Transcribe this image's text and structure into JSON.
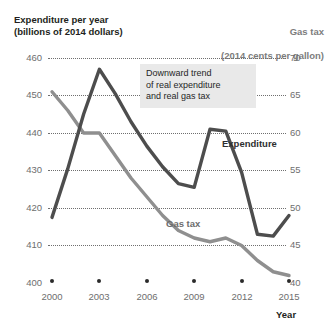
{
  "left_axis": {
    "title": "Expenditure per year\n(billions of 2014 dollars)",
    "ticks": [
      "460",
      "450",
      "440",
      "430",
      "420",
      "410",
      "400"
    ]
  },
  "right_axis": {
    "title_line1": "Gas tax",
    "title_line2": "(2014 cents per gallon)",
    "ticks": [
      "70",
      "65",
      "60",
      "55",
      "50",
      "45",
      "40"
    ]
  },
  "x_axis": {
    "title": "Year",
    "ticks": [
      "2000",
      "2003",
      "2006",
      "2009",
      "2012",
      "2015"
    ]
  },
  "callout": {
    "text": "Downward trend\nof real expenditure\nand real gas tax"
  },
  "series_labels": {
    "expenditure": "Expenditure",
    "gas_tax": "Gas tax"
  },
  "colors": {
    "expenditure_line": "#4d4d4d",
    "gas_tax_line": "#8f8f8f",
    "gridline": "#6f6f6f",
    "callout_bg": "#e9e9e9",
    "axis_text": "#6e6e6e",
    "title_text": "#231f20"
  },
  "chart_data": {
    "type": "line",
    "xlabel": "Year",
    "ylabel": "Expenditure per year (billions of 2014 dollars)",
    "y2label": "Gas tax (2014 cents per gallon)",
    "ylim": [
      400,
      460
    ],
    "y2lim": [
      40,
      70
    ],
    "xlim": [
      2000,
      2015
    ],
    "yticks": [
      400,
      410,
      420,
      430,
      440,
      450,
      460
    ],
    "y2ticks": [
      40,
      45,
      50,
      55,
      60,
      65,
      70
    ],
    "xticks": [
      2000,
      2003,
      2006,
      2009,
      2012,
      2015
    ],
    "grid": "horizontal-dotted",
    "legend": "inline-labels",
    "annotations": [
      {
        "text": "Downward trend of real expenditure and real gas tax",
        "x": 2006,
        "y": 447
      }
    ],
    "series": [
      {
        "name": "Expenditure",
        "axis": "left",
        "units": "billions of 2014 dollars",
        "color": "#4d4d4d",
        "x": [
          2000,
          2001,
          2002,
          2003,
          2004,
          2005,
          2006,
          2007,
          2008,
          2009,
          2010,
          2011,
          2012,
          2013,
          2014,
          2015
        ],
        "values": [
          417.5,
          430.5,
          445.0,
          457.0,
          450.5,
          443.0,
          436.5,
          431.0,
          426.5,
          425.5,
          441.0,
          440.5,
          429.5,
          413.0,
          412.5,
          418.0
        ]
      },
      {
        "name": "Gas tax",
        "axis": "right",
        "units": "2014 cents per gallon",
        "color": "#8f8f8f",
        "x": [
          2000,
          2001,
          2002,
          2003,
          2004,
          2005,
          2006,
          2007,
          2008,
          2009,
          2010,
          2011,
          2012,
          2013,
          2014,
          2015
        ],
        "values": [
          65.5,
          63.0,
          60.0,
          60.0,
          57.0,
          54.0,
          51.5,
          49.0,
          47.0,
          46.0,
          45.5,
          46.0,
          45.0,
          43.0,
          41.5,
          41.0
        ]
      }
    ]
  }
}
